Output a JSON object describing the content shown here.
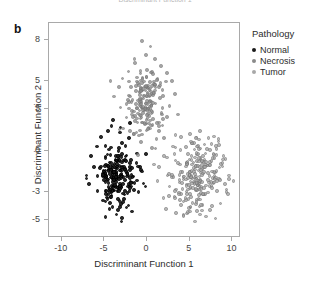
{
  "panel": {
    "letter": "b",
    "top_caption_sliver": "Discriminant Function 1"
  },
  "legend": {
    "title": "Pathology",
    "entries": [
      {
        "label": "Normal",
        "color": "#1a1a1a"
      },
      {
        "label": "Necrosis",
        "color": "#8a8a8a"
      },
      {
        "label": "Tumor",
        "color": "#a8a8a8"
      }
    ]
  },
  "chart_data": {
    "type": "scatter",
    "title": "",
    "xlabel": "Discriminant Function 1",
    "ylabel": "Discriminant Function 2",
    "xlim": [
      -11.5,
      11.0
    ],
    "ylim": [
      -6.3,
      9.2
    ],
    "xticks": [
      -10,
      -5,
      0,
      5,
      10
    ],
    "yticks": [
      8,
      5,
      3,
      0,
      -3,
      -5
    ],
    "grid": false,
    "legend_position": "right",
    "series": [
      {
        "name": "Normal",
        "color": "#1a1a1a",
        "n": 210,
        "center": [
          -3.5,
          -1.9
        ],
        "spread": [
          1.05,
          1.05
        ],
        "seed": 11,
        "outliers": [
          [
            -6.6,
            -0.4
          ],
          [
            -6.2,
            -1.2
          ],
          [
            -5.9,
            0.3
          ],
          [
            -6.8,
            -2.4
          ],
          [
            -5.4,
            1.0
          ],
          [
            -4.6,
            1.4
          ],
          [
            -3.2,
            1.3
          ],
          [
            -2.1,
            0.9
          ],
          [
            -1.2,
            -0.2
          ],
          [
            -0.6,
            -1.5
          ],
          [
            -1.0,
            -3.0
          ],
          [
            -2.4,
            -4.1
          ],
          [
            -3.6,
            -4.6
          ],
          [
            -4.4,
            -4.2
          ],
          [
            -5.2,
            -3.6
          ],
          [
            -3.0,
            -5.1
          ],
          [
            -4.9,
            -4.8
          ],
          [
            -2.8,
            -3.7
          ],
          [
            -1.8,
            -4.4
          ],
          [
            -5.8,
            -2.9
          ],
          [
            -0.2,
            -2.6
          ],
          [
            -7.1,
            -1.8
          ],
          [
            -2.0,
            2.0
          ],
          [
            -4.0,
            2.2
          ]
        ]
      },
      {
        "name": "Necrosis",
        "color": "#8f8f8f",
        "n": 180,
        "center": [
          0.0,
          3.4
        ],
        "spread": [
          0.95,
          1.25
        ],
        "seed": 29,
        "outliers": [
          [
            -0.6,
            7.9
          ],
          [
            0.4,
            7.5
          ],
          [
            -0.1,
            6.9
          ],
          [
            0.9,
            6.6
          ],
          [
            -1.4,
            6.3
          ],
          [
            1.6,
            6.1
          ],
          [
            -2.2,
            5.7
          ],
          [
            2.3,
            5.6
          ],
          [
            -2.9,
            5.2
          ],
          [
            -3.3,
            4.6
          ],
          [
            2.9,
            5.0
          ],
          [
            -3.9,
            3.9
          ],
          [
            -3.1,
            3.1
          ],
          [
            -2.4,
            2.4
          ],
          [
            3.3,
            4.1
          ],
          [
            2.6,
            3.2
          ],
          [
            -1.6,
            1.2
          ],
          [
            -0.7,
            0.6
          ],
          [
            0.6,
            0.2
          ],
          [
            -1.1,
            -0.3
          ],
          [
            1.4,
            1.4
          ],
          [
            -2.8,
            1.6
          ],
          [
            3.6,
            2.6
          ],
          [
            -4.3,
            5.0
          ]
        ]
      },
      {
        "name": "Tumor",
        "color": "#a8a8a8",
        "n": 230,
        "center": [
          6.1,
          -1.9
        ],
        "spread": [
          1.45,
          1.25
        ],
        "seed": 47,
        "outliers": [
          [
            2.0,
            -0.4
          ],
          [
            1.4,
            -1.2
          ],
          [
            2.6,
            -2.6
          ],
          [
            1.9,
            -3.4
          ],
          [
            3.0,
            0.3
          ],
          [
            3.6,
            -0.9
          ],
          [
            2.4,
            -1.8
          ],
          [
            3.2,
            -3.3
          ],
          [
            4.0,
            1.0
          ],
          [
            5.0,
            1.2
          ],
          [
            6.2,
            1.4
          ],
          [
            7.2,
            0.9
          ],
          [
            8.4,
            0.4
          ],
          [
            9.2,
            -0.6
          ],
          [
            9.6,
            -1.8
          ],
          [
            9.3,
            -2.8
          ],
          [
            8.6,
            -3.8
          ],
          [
            7.4,
            -4.3
          ],
          [
            6.2,
            -4.6
          ],
          [
            5.0,
            -4.4
          ],
          [
            4.0,
            -3.9
          ],
          [
            3.4,
            -4.5
          ],
          [
            8.0,
            -4.9
          ],
          [
            10.1,
            -2.2
          ],
          [
            1.2,
            -2.2
          ],
          [
            0.8,
            -1.0
          ],
          [
            2.2,
            -4.2
          ],
          [
            5.6,
            -5.1
          ]
        ]
      }
    ]
  }
}
